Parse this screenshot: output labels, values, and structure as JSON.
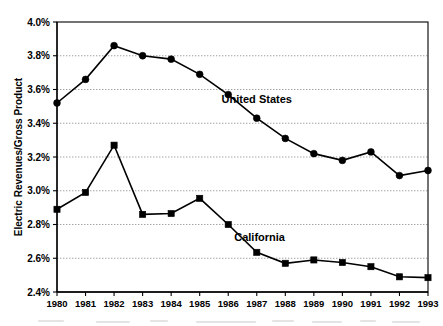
{
  "chart_data": {
    "type": "line",
    "title": "",
    "xlabel": "",
    "ylabel": "Electric Revenues/Gross Product",
    "x": [
      1980,
      1981,
      1982,
      1983,
      1984,
      1985,
      1986,
      1987,
      1988,
      1989,
      1990,
      1991,
      1992,
      1993
    ],
    "x_tick_labels": [
      "1980",
      "1981",
      "1982",
      "1983",
      "1984",
      "1985",
      "1986",
      "1987",
      "1988",
      "1989",
      "1990",
      "1991",
      "1992",
      "1993"
    ],
    "y_tick_labels": [
      "2.4%",
      "2.6%",
      "2.8%",
      "3.0%",
      "3.2%",
      "3.4%",
      "3.6%",
      "3.8%",
      "4.0%"
    ],
    "y_tick_values": [
      2.4,
      2.6,
      2.8,
      3.0,
      3.2,
      3.4,
      3.6,
      3.8,
      4.0
    ],
    "ylim": [
      2.4,
      4.0
    ],
    "xlim": [
      1980,
      1993
    ],
    "y_unit": "%",
    "grid": true,
    "legend_position": "inline-annotation",
    "series": [
      {
        "name": "United States",
        "marker": "circle",
        "color": "#000000",
        "label_x": 1987.0,
        "label_y": 3.52,
        "values": [
          3.52,
          3.66,
          3.86,
          3.8,
          3.78,
          3.69,
          3.57,
          3.43,
          3.31,
          3.22,
          3.18,
          3.23,
          3.09,
          3.12
        ]
      },
      {
        "name": "California",
        "marker": "square",
        "color": "#000000",
        "label_x": 1987.1,
        "label_y": 2.7,
        "values": [
          2.89,
          2.99,
          3.27,
          2.86,
          2.865,
          2.955,
          2.8,
          2.635,
          2.57,
          2.59,
          2.575,
          2.55,
          2.49,
          2.485
        ]
      }
    ]
  },
  "layout": {
    "plot": {
      "left": 57,
      "top": 22,
      "right": 428,
      "bottom": 292
    },
    "canvas": {
      "width": 443,
      "height": 326
    }
  },
  "icons": {
    "circle_marker": "circle-marker-icon",
    "square_marker": "square-marker-icon"
  }
}
